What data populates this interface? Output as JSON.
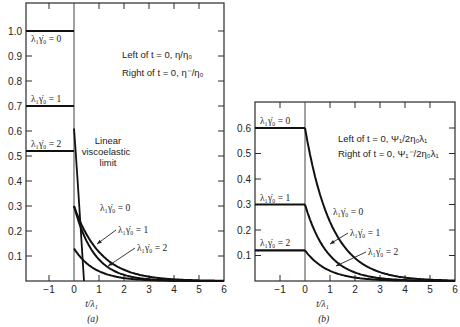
{
  "chart_data": [
    {
      "id": "a",
      "type": "line",
      "caption": "(a)",
      "xlabel": "t/λ₁",
      "ylabel": "",
      "xlim": [
        -1.9,
        6
      ],
      "ylim": [
        0,
        1.1
      ],
      "xticks": [
        -1,
        0,
        1,
        2,
        3,
        4,
        5,
        6
      ],
      "yticks": [
        0.1,
        0.2,
        0.3,
        0.4,
        0.5,
        0.6,
        0.7,
        0.8,
        0.9,
        1.0
      ],
      "yticklabels": [
        "0.1",
        "0.2",
        "0.3",
        "0.4",
        "0.5",
        "0.6",
        "0.7",
        "0.8",
        "0.9",
        "1.0"
      ],
      "legend_note": [
        "Left of t = 0, η/η₀",
        "Right of t = 0, η⁻/η₀"
      ],
      "steady_levels": [
        {
          "label": "λ₁γ̇₀ = 0",
          "value": 1.0
        },
        {
          "label": "λ₁γ̇₀ = 1",
          "value": 0.7
        },
        {
          "label": "λ₁γ̇₀ = 2",
          "value": 0.52
        }
      ],
      "series": [
        {
          "name": "λ₁γ̇₀ = 0",
          "start": 0.3,
          "decay": 0.95,
          "x": [
            0,
            0.5,
            1,
            1.5,
            2,
            3,
            4,
            5,
            6
          ],
          "values": [
            0.3,
            0.18,
            0.115,
            0.07,
            0.045,
            0.017,
            0.006,
            0.002,
            0.001
          ]
        },
        {
          "name": "λ₁γ̇₀ = 1",
          "start": 0.3,
          "decay": 1.25,
          "x": [
            0,
            0.5,
            1,
            2,
            3,
            4
          ],
          "values": [
            0.3,
            0.16,
            0.086,
            0.025,
            0.007,
            0.002
          ]
        },
        {
          "name": "λ₁γ̇₀ = 2",
          "start": 0.13,
          "decay": 1.2,
          "x": [
            0,
            0.5,
            1,
            2,
            3
          ],
          "values": [
            0.13,
            0.07,
            0.039,
            0.012,
            0.003
          ]
        }
      ],
      "linear_limit": {
        "label": [
          "Linear",
          "viscoelastic",
          "limit"
        ],
        "start": 0.61,
        "decay": 8.0
      }
    },
    {
      "id": "b",
      "type": "line",
      "caption": "(b)",
      "xlabel": "t/λ₁",
      "ylabel": "",
      "xlim": [
        -1.95,
        6
      ],
      "ylim": [
        0,
        0.7
      ],
      "xticks": [
        -1,
        0,
        1,
        2,
        3,
        4,
        5,
        6
      ],
      "yticks": [
        0.1,
        0.2,
        0.3,
        0.4,
        0.5,
        0.6
      ],
      "yticklabels": [
        "0.1",
        "0.2",
        "0.3",
        "0.4",
        "0.5",
        "0.6"
      ],
      "legend_note": [
        "Left of t = 0, Ψ₁/2η₀λ₁",
        "Right of t = 0, Ψ₁⁻/2η₀λ₁"
      ],
      "steady_levels": [
        {
          "label": "λ₁γ̇₀ = 0",
          "value": 0.6
        },
        {
          "label": "λ₁γ̇₀ = 1",
          "value": 0.3
        },
        {
          "label": "λ₁γ̇₀ = 2",
          "value": 0.12
        }
      ],
      "series": [
        {
          "name": "λ₁γ̇₀ = 0",
          "start": 0.6,
          "decay": 0.95,
          "x": [
            0,
            0.5,
            1,
            2,
            3,
            4,
            5,
            6
          ],
          "values": [
            0.6,
            0.37,
            0.23,
            0.09,
            0.035,
            0.013,
            0.005,
            0.002
          ]
        },
        {
          "name": "λ₁γ̇₀ = 1",
          "start": 0.3,
          "decay": 1.1,
          "x": [
            0,
            0.5,
            1,
            2,
            3,
            4
          ],
          "values": [
            0.3,
            0.17,
            0.1,
            0.033,
            0.011,
            0.004
          ]
        },
        {
          "name": "λ₁γ̇₀ = 2",
          "start": 0.12,
          "decay": 1.1,
          "x": [
            0,
            0.5,
            1,
            2,
            3
          ],
          "values": [
            0.12,
            0.07,
            0.04,
            0.013,
            0.004
          ]
        }
      ]
    }
  ]
}
